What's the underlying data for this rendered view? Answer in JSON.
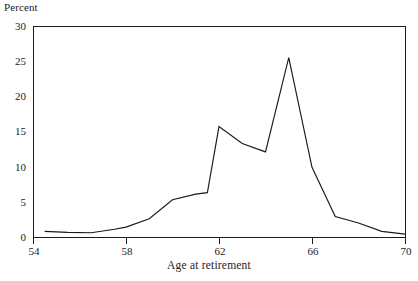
{
  "chart_data": {
    "type": "line",
    "title": "",
    "subtitle": "",
    "xlabel": "Age at retirement",
    "ylabel": "Percent",
    "xlim": [
      54,
      70
    ],
    "ylim": [
      0,
      30
    ],
    "xticks": [
      54,
      58,
      62,
      66,
      70
    ],
    "yticks": [
      0,
      5,
      10,
      15,
      20,
      25,
      30
    ],
    "xtick_labels": [
      "54",
      "58",
      "62",
      "66",
      "70"
    ],
    "ytick_labels": [
      "0",
      "5",
      "10",
      "15",
      "20",
      "25",
      "30"
    ],
    "grid": false,
    "legend": null,
    "legend_position": "none",
    "annotations": [],
    "line_color": "#1a1a1a",
    "series": [
      {
        "name": "Percent retiring",
        "x": [
          54.5,
          55.5,
          56.5,
          57.5,
          58.0,
          59.0,
          60.0,
          61.0,
          61.5,
          62.0,
          63.0,
          64.0,
          65.0,
          66.0,
          67.0,
          68.0,
          69.0,
          70.0
        ],
        "values": [
          0.8,
          0.65,
          0.6,
          1.1,
          1.4,
          2.6,
          5.3,
          6.1,
          6.3,
          15.7,
          13.3,
          12.1,
          25.5,
          9.9,
          2.9,
          2.0,
          0.8,
          0.4
        ]
      }
    ]
  },
  "axes": {
    "frame_color": "#1a1a1a",
    "plot_left_px": 33,
    "plot_right_px": 405,
    "plot_top_px": 26,
    "plot_bottom_px": 237
  }
}
